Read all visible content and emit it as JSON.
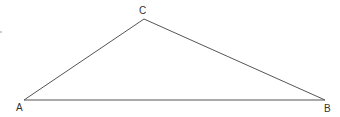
{
  "diagram": {
    "type": "triangle",
    "vertices": [
      {
        "label": "A",
        "x": 24,
        "y": 100,
        "label_x": 17,
        "label_y": 111
      },
      {
        "label": "B",
        "x": 325,
        "y": 100,
        "label_x": 324,
        "label_y": 112
      },
      {
        "label": "C",
        "x": 144,
        "y": 19,
        "label_x": 139,
        "label_y": 14
      }
    ],
    "edges": [
      [
        "A",
        "B"
      ],
      [
        "B",
        "C"
      ],
      [
        "C",
        "A"
      ]
    ],
    "stroke_color": "#555555",
    "stray_mark": {
      "x": 1,
      "y": 32
    }
  }
}
